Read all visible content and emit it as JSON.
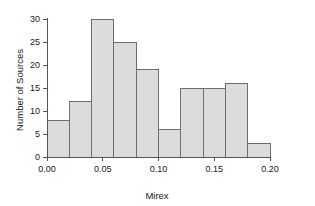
{
  "chart_data": {
    "type": "bar",
    "title": "",
    "subtitle": "",
    "xlabel": "Mirex",
    "ylabel": "Number of Sources",
    "xlim": [
      0.0,
      0.2
    ],
    "ylim": [
      0,
      30
    ],
    "grid": false,
    "legend": null,
    "bin_width": 0.02,
    "bin_edges": [
      0.0,
      0.02,
      0.04,
      0.06,
      0.08,
      0.1,
      0.12,
      0.14,
      0.16,
      0.18,
      0.2
    ],
    "categories": [
      "0.00-0.02",
      "0.02-0.04",
      "0.04-0.06",
      "0.06-0.08",
      "0.08-0.10",
      "0.10-0.12",
      "0.12-0.14",
      "0.14-0.16",
      "0.16-0.18",
      "0.18-0.20"
    ],
    "values": [
      8,
      12,
      30,
      25,
      19,
      6,
      15,
      15,
      16,
      3
    ],
    "xticks": [
      0.0,
      0.05,
      0.1,
      0.15,
      0.2
    ],
    "xtick_labels": [
      "0.00",
      "0.05",
      "0.10",
      "0.15",
      "0.20"
    ],
    "yticks": [
      0,
      5,
      10,
      15,
      20,
      25,
      30
    ],
    "ytick_labels": [
      "0",
      "5",
      "10",
      "15",
      "20",
      "25",
      "30"
    ],
    "bar_fill_color": "#dcdcdc",
    "bar_edge_color": "#6e6e6e",
    "axis_color": "#555555",
    "background_color": "#ffffff"
  }
}
